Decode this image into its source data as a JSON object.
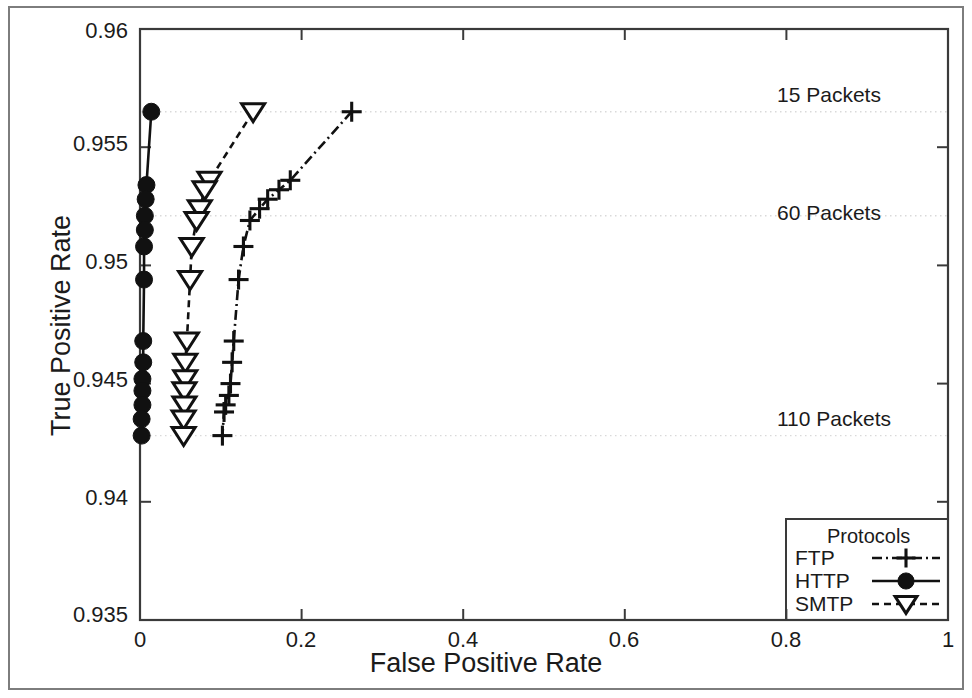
{
  "chart_data": {
    "type": "line",
    "title": "",
    "xlabel": "False Positive Rate",
    "ylabel": "True Positive Rate",
    "xlim": [
      0,
      1
    ],
    "ylim": [
      0.935,
      0.96
    ],
    "xticks": [
      "0",
      "0.2",
      "0.4",
      "0.6",
      "0.8",
      "1"
    ],
    "xtick_values": [
      0,
      0.2,
      0.4,
      0.6,
      0.8,
      1
    ],
    "yticks": [
      "0.935",
      "0.94",
      "0.945",
      "0.95",
      "0.955",
      "0.96"
    ],
    "ytick_values": [
      0.935,
      0.94,
      0.945,
      0.95,
      0.955,
      0.96
    ],
    "grid": "horizontal-dotted",
    "gridlines_y": [
      0.9565,
      0.9521,
      0.9428
    ],
    "legend": {
      "title": "Protocols",
      "position": "bottom-right",
      "entries": [
        {
          "name": "FTP",
          "marker": "plus",
          "line": "dash-dot",
          "color": "#111111"
        },
        {
          "name": "HTTP",
          "marker": "filled-circle",
          "line": "solid",
          "color": "#111111"
        },
        {
          "name": "SMTP",
          "marker": "open-triangle-down",
          "line": "dashed",
          "color": "#111111"
        }
      ]
    },
    "annotations": [
      {
        "text": "15 Packets",
        "x": 0.78,
        "y": 0.9572
      },
      {
        "text": "60 Packets",
        "x": 0.78,
        "y": 0.9528
      },
      {
        "text": "110 Packets",
        "x": 0.78,
        "y": 0.9435
      }
    ],
    "series": [
      {
        "name": "FTP",
        "marker": "plus",
        "line": "dash-dot",
        "points": [
          [
            0.262,
            0.9565
          ],
          [
            0.186,
            0.9536
          ],
          [
            0.172,
            0.9532
          ],
          [
            0.158,
            0.9528
          ],
          [
            0.148,
            0.9524
          ],
          [
            0.136,
            0.9519
          ],
          [
            0.128,
            0.9508
          ],
          [
            0.122,
            0.9494
          ],
          [
            0.116,
            0.9468
          ],
          [
            0.114,
            0.9459
          ],
          [
            0.112,
            0.945
          ],
          [
            0.11,
            0.9445
          ],
          [
            0.106,
            0.9441
          ],
          [
            0.104,
            0.9438
          ],
          [
            0.102,
            0.9428
          ]
        ]
      },
      {
        "name": "HTTP",
        "marker": "filled-circle",
        "line": "solid",
        "points": [
          [
            0.014,
            0.9565
          ],
          [
            0.008,
            0.9534
          ],
          [
            0.007,
            0.9528
          ],
          [
            0.006,
            0.9521
          ],
          [
            0.006,
            0.9515
          ],
          [
            0.005,
            0.9508
          ],
          [
            0.005,
            0.9494
          ],
          [
            0.004,
            0.9468
          ],
          [
            0.004,
            0.9459
          ],
          [
            0.003,
            0.9452
          ],
          [
            0.003,
            0.9447
          ],
          [
            0.003,
            0.9441
          ],
          [
            0.002,
            0.9435
          ],
          [
            0.002,
            0.9428
          ]
        ]
      },
      {
        "name": "SMTP",
        "marker": "open-triangle-down",
        "line": "dashed",
        "points": [
          [
            0.14,
            0.9565
          ],
          [
            0.086,
            0.9536
          ],
          [
            0.08,
            0.9532
          ],
          [
            0.074,
            0.9524
          ],
          [
            0.07,
            0.9519
          ],
          [
            0.064,
            0.9508
          ],
          [
            0.062,
            0.9494
          ],
          [
            0.058,
            0.9468
          ],
          [
            0.056,
            0.9459
          ],
          [
            0.056,
            0.9452
          ],
          [
            0.055,
            0.9447
          ],
          [
            0.055,
            0.9441
          ],
          [
            0.054,
            0.9435
          ],
          [
            0.054,
            0.9428
          ]
        ]
      }
    ]
  },
  "axes": {
    "xlabel": "False Positive Rate",
    "ylabel": "True Positive Rate"
  },
  "legend": {
    "title": "Protocols",
    "ftp": "FTP",
    "http": "HTTP",
    "smtp": "SMTP"
  },
  "annotations": {
    "a15": "15 Packets",
    "a60": "60 Packets",
    "a110": "110 Packets"
  },
  "ticks": {
    "y": [
      "0.96",
      "0.955",
      "0.95",
      "0.945",
      "0.94",
      "0.935"
    ],
    "x": [
      "0",
      "0.2",
      "0.4",
      "0.6",
      "0.8",
      "1"
    ]
  },
  "colors": {
    "ink": "#111111",
    "frame": "#7d7d7d",
    "grid": "#d9d9d9",
    "background": "#ffffff"
  }
}
